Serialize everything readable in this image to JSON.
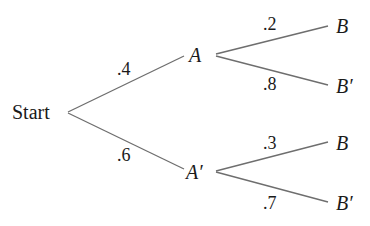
{
  "diagram": {
    "type": "probability-tree",
    "colors": {
      "line": "#6e6e6e",
      "text": "#1a1a1a",
      "background": "#ffffff"
    },
    "nodes": {
      "root": {
        "label": "Start"
      },
      "a": {
        "label": "A"
      },
      "a_prime": {
        "label": "A′"
      },
      "a_b": {
        "label": "B"
      },
      "a_b_prime": {
        "label": "B′"
      },
      "ap_b": {
        "label": "B"
      },
      "ap_b_prime": {
        "label": "B′"
      }
    },
    "edges": {
      "start_a": {
        "from": "Start",
        "to": "A",
        "probability": ".4"
      },
      "start_a_prime": {
        "from": "Start",
        "to": "A′",
        "probability": ".6"
      },
      "a_b": {
        "from": "A",
        "to": "B",
        "probability": ".2"
      },
      "a_b_prime": {
        "from": "A",
        "to": "B′",
        "probability": ".8"
      },
      "ap_b": {
        "from": "A′",
        "to": "B",
        "probability": ".3"
      },
      "ap_b_prime": {
        "from": "A′",
        "to": "B′",
        "probability": ".7"
      }
    }
  }
}
